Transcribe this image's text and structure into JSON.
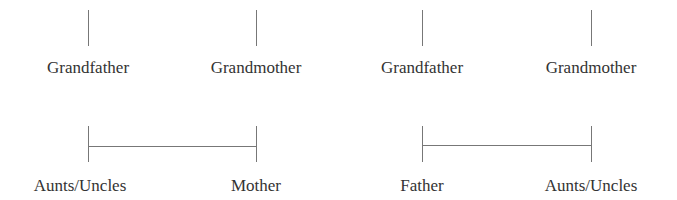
{
  "diagram": {
    "title": "",
    "row1": {
      "nodes": [
        {
          "label": "Grandfather",
          "x": 88
        },
        {
          "label": "Grandmother",
          "x": 256
        },
        {
          "label": "Grandfather",
          "x": 422
        },
        {
          "label": "Grandmother",
          "x": 591
        }
      ]
    },
    "row2": {
      "nodes": [
        {
          "label": "Aunts/Uncles",
          "x": 80
        },
        {
          "label": "Mother",
          "x": 256
        },
        {
          "label": "Father",
          "x": 422
        },
        {
          "label": "Aunts/Uncles",
          "x": 591
        }
      ]
    },
    "line_color": "#777777",
    "text_color": "#333333"
  }
}
